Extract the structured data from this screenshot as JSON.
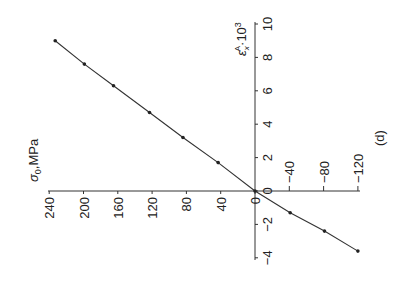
{
  "chart_data": {
    "type": "line",
    "panel_label": "(d)",
    "rotation_deg": -90,
    "xlabel": "σ0, MPa",
    "ylabel": "εxA·10^3",
    "x_ticks": [
      240,
      200,
      160,
      120,
      80,
      40,
      0,
      -40,
      -80,
      -120
    ],
    "x_tick_labels": [
      "240",
      "200",
      "160",
      "120",
      "80",
      "40",
      "0",
      "−40",
      "−80",
      "−120"
    ],
    "y_ticks": [
      10,
      8,
      6,
      4,
      2,
      0,
      -2,
      -4
    ],
    "y_tick_labels": [
      "10",
      "8",
      "6",
      "4",
      "2",
      "0",
      "−2",
      "−4"
    ],
    "xlim": [
      240,
      -120
    ],
    "ylim": [
      -4,
      10
    ],
    "grid": false,
    "legend": null,
    "series": [
      {
        "name": "εxA vs σ0",
        "marker": "dot",
        "x": [
          233,
          199,
          165,
          123,
          84,
          43,
          0,
          -41,
          -81,
          -120
        ],
        "y": [
          9.0,
          7.6,
          6.3,
          4.7,
          3.2,
          1.7,
          0.0,
          -1.3,
          -2.4,
          -3.6
        ]
      }
    ]
  },
  "labels": {
    "sigma_label": "σ",
    "sigma_sub": "0",
    "sigma_unit": ",MPa",
    "eps_label": "ε",
    "eps_sub": "x",
    "eps_sup": "A",
    "eps_scale": "·10",
    "eps_scale_exp": "3",
    "panel": "(d)"
  }
}
